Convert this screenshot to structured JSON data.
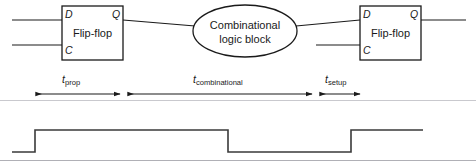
{
  "diagram": {
    "colors": {
      "stroke": "#1a1a1a",
      "text": "#1a1a1a",
      "divider": "#b9b9bd",
      "background": "#ffffff"
    },
    "blocks": [
      {
        "id": "flipflop-left",
        "label": "Flip-flop",
        "ports": {
          "d": "D",
          "q": "Q",
          "c": "C"
        }
      },
      {
        "id": "combinational-logic",
        "label_line1": "Combinational",
        "label_line2": "logic block"
      },
      {
        "id": "flipflop-right",
        "label": "Flip-flop",
        "ports": {
          "d": "D",
          "q": "Q",
          "c": "C"
        }
      }
    ],
    "timing_segments": [
      {
        "id": "t-prop",
        "symbol": "t",
        "subscript": "prop"
      },
      {
        "id": "t-combinational",
        "symbol": "t",
        "subscript": "combinational"
      },
      {
        "id": "t-setup",
        "symbol": "t",
        "subscript": "setup"
      }
    ],
    "waveform": {
      "name": "clock-waveform",
      "levels": {
        "high": "1",
        "low": "0"
      }
    }
  }
}
